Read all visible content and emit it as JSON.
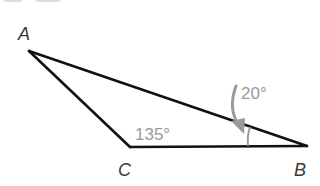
{
  "diagram": {
    "type": "triangle",
    "vertices": {
      "A": {
        "label": "A",
        "x": 29,
        "y": 51
      },
      "B": {
        "label": "B",
        "x": 307,
        "y": 146
      },
      "C": {
        "label": "C",
        "x": 130,
        "y": 147
      }
    },
    "angles": {
      "C": {
        "label": "135°",
        "value": 135
      },
      "B": {
        "label": "20°",
        "value": 20
      }
    },
    "colors": {
      "stroke": "#111111",
      "annotation": "#9a9a9a",
      "label": "#3a3a3a"
    }
  }
}
